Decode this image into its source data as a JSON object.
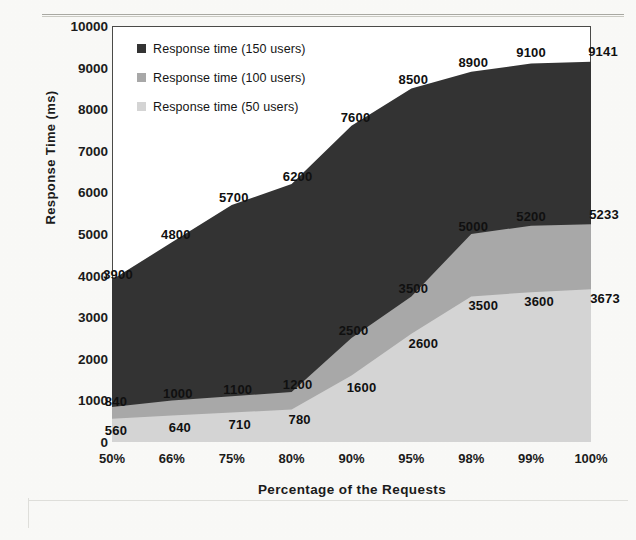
{
  "chart_data": {
    "type": "area",
    "title": "",
    "xlabel": "Percentage of the Requests",
    "ylabel": "Response Time (ms)",
    "categories": [
      "50%",
      "66%",
      "75%",
      "80%",
      "90%",
      "95%",
      "98%",
      "99%",
      "100%"
    ],
    "ylim": [
      0,
      10000
    ],
    "ytick_step": 1000,
    "yticks": [
      "0",
      "1000",
      "2000",
      "3000",
      "4000",
      "5000",
      "6000",
      "7000",
      "8000",
      "9000",
      "10000"
    ],
    "grid": false,
    "legend_position": "top-left",
    "stacked": false,
    "series": [
      {
        "name": "Response time (150 users)",
        "color": "#333333",
        "values": [
          3900,
          4800,
          5700,
          6200,
          7600,
          8500,
          8900,
          9100,
          9141
        ]
      },
      {
        "name": "Response time (100 users)",
        "color": "#a8a8a8",
        "values": [
          840,
          1000,
          1100,
          1200,
          2500,
          3500,
          5000,
          5200,
          5233
        ]
      },
      {
        "name": "Response time (50 users)",
        "color": "#d4d4d4",
        "values": [
          560,
          640,
          710,
          780,
          1600,
          2600,
          3500,
          3600,
          3673
        ]
      }
    ],
    "data_labels": [
      {
        "series": 0,
        "index": 0,
        "text": "3900"
      },
      {
        "series": 0,
        "index": 1,
        "text": "4800"
      },
      {
        "series": 0,
        "index": 2,
        "text": "5700"
      },
      {
        "series": 0,
        "index": 3,
        "text": "6200"
      },
      {
        "series": 0,
        "index": 4,
        "text": "7600"
      },
      {
        "series": 0,
        "index": 5,
        "text": "8500"
      },
      {
        "series": 0,
        "index": 6,
        "text": "8900"
      },
      {
        "series": 0,
        "index": 7,
        "text": "9100"
      },
      {
        "series": 0,
        "index": 8,
        "text": "9141"
      },
      {
        "series": 1,
        "index": 0,
        "text": "840"
      },
      {
        "series": 1,
        "index": 1,
        "text": "1000"
      },
      {
        "series": 1,
        "index": 2,
        "text": "1100"
      },
      {
        "series": 1,
        "index": 3,
        "text": "1200"
      },
      {
        "series": 1,
        "index": 4,
        "text": "2500"
      },
      {
        "series": 1,
        "index": 5,
        "text": "3500"
      },
      {
        "series": 1,
        "index": 6,
        "text": "5000"
      },
      {
        "series": 1,
        "index": 7,
        "text": "5200"
      },
      {
        "series": 1,
        "index": 8,
        "text": "5233"
      },
      {
        "series": 2,
        "index": 0,
        "text": "560"
      },
      {
        "series": 2,
        "index": 1,
        "text": "640"
      },
      {
        "series": 2,
        "index": 2,
        "text": "710"
      },
      {
        "series": 2,
        "index": 3,
        "text": "780"
      },
      {
        "series": 2,
        "index": 4,
        "text": "1600"
      },
      {
        "series": 2,
        "index": 5,
        "text": "2600"
      },
      {
        "series": 2,
        "index": 6,
        "text": "3500"
      },
      {
        "series": 2,
        "index": 7,
        "text": "3600"
      },
      {
        "series": 2,
        "index": 8,
        "text": "3673"
      }
    ]
  }
}
